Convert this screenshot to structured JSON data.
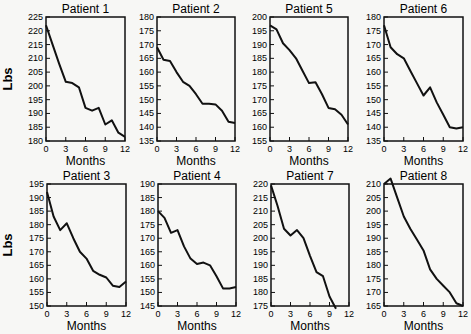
{
  "ylabel": "Lbs",
  "xlabel": "Months",
  "chart_data": [
    {
      "type": "line",
      "title": "Patient 1",
      "xlabel": "Months",
      "ylabel": "Lbs",
      "ylim": [
        180,
        225
      ],
      "yticks": [
        180,
        185,
        190,
        195,
        200,
        205,
        210,
        215,
        220,
        225
      ],
      "xticks": [
        0,
        3,
        6,
        9,
        12
      ],
      "x": [
        0,
        1,
        2,
        3,
        4,
        5,
        6,
        7,
        8,
        9,
        10,
        11,
        12
      ],
      "values": [
        222,
        215,
        208,
        201.5,
        201,
        199.5,
        192,
        191,
        192,
        186,
        187.5,
        183,
        181.5
      ]
    },
    {
      "type": "line",
      "title": "Patient 2",
      "xlabel": "Months",
      "ylabel": "",
      "ylim": [
        135,
        180
      ],
      "yticks": [
        135,
        140,
        145,
        150,
        155,
        160,
        165,
        170,
        175,
        180
      ],
      "xticks": [
        0,
        3,
        6,
        9,
        12
      ],
      "x": [
        0,
        1,
        2,
        3,
        4,
        5,
        6,
        7,
        8,
        9,
        10,
        11,
        12
      ],
      "values": [
        169,
        164.5,
        164,
        160,
        156.5,
        155,
        152,
        148.5,
        148.5,
        148.3,
        146,
        142,
        141.5
      ]
    },
    {
      "type": "line",
      "title": "Patient 5",
      "xlabel": "Months",
      "ylabel": "",
      "ylim": [
        155,
        200
      ],
      "yticks": [
        155,
        160,
        165,
        170,
        175,
        180,
        185,
        190,
        195,
        200
      ],
      "xticks": [
        0,
        3,
        6,
        9,
        12
      ],
      "x": [
        0,
        1,
        2,
        3,
        4,
        5,
        6,
        7,
        8,
        9,
        10,
        11,
        12
      ],
      "values": [
        197,
        195.5,
        190.5,
        188,
        185,
        180.5,
        176,
        176.3,
        172,
        167,
        166.5,
        164.5,
        161
      ]
    },
    {
      "type": "line",
      "title": "Patient 6",
      "xlabel": "Months",
      "ylabel": "",
      "ylim": [
        135,
        180
      ],
      "yticks": [
        135,
        140,
        145,
        150,
        155,
        160,
        165,
        170,
        175,
        180
      ],
      "xticks": [
        0,
        3,
        6,
        9,
        12
      ],
      "x": [
        0,
        1,
        2,
        3,
        4,
        5,
        6,
        7,
        8,
        9,
        10,
        11,
        12
      ],
      "values": [
        177,
        169,
        166.5,
        165,
        160.5,
        156,
        151.5,
        154.5,
        149,
        144.5,
        140,
        139.5,
        140
      ]
    },
    {
      "type": "line",
      "title": "Patient 3",
      "xlabel": "Months",
      "ylabel": "Lbs",
      "ylim": [
        150,
        195
      ],
      "yticks": [
        150,
        155,
        160,
        165,
        170,
        175,
        180,
        185,
        190,
        195
      ],
      "xticks": [
        0,
        3,
        6,
        9,
        12
      ],
      "x": [
        0,
        1,
        2,
        3,
        4,
        5,
        6,
        7,
        8,
        9,
        10,
        11,
        12
      ],
      "values": [
        192,
        183,
        178,
        180.5,
        175,
        170,
        167.5,
        163,
        161.5,
        160.5,
        157.5,
        157,
        159
      ]
    },
    {
      "type": "line",
      "title": "Patient 4",
      "xlabel": "Months",
      "ylabel": "",
      "ylim": [
        145,
        190
      ],
      "yticks": [
        145,
        150,
        155,
        160,
        165,
        170,
        175,
        180,
        185,
        190
      ],
      "xticks": [
        0,
        3,
        6,
        9,
        12
      ],
      "x": [
        0,
        1,
        2,
        3,
        4,
        5,
        6,
        7,
        8,
        9,
        10,
        11,
        12
      ],
      "values": [
        180,
        177.5,
        172,
        173,
        167,
        162.5,
        160.5,
        161,
        160,
        156,
        151.5,
        151.5,
        152
      ]
    },
    {
      "type": "line",
      "title": "Patient 7",
      "xlabel": "Months",
      "ylabel": "",
      "ylim": [
        175,
        220
      ],
      "yticks": [
        175,
        180,
        185,
        190,
        195,
        200,
        205,
        210,
        215,
        220
      ],
      "xticks": [
        0,
        3,
        6,
        9,
        12
      ],
      "x": [
        0,
        1,
        2,
        3,
        4,
        5,
        6,
        7,
        8,
        9,
        10,
        11,
        12
      ],
      "values": [
        219.5,
        212,
        203.5,
        201,
        203,
        200,
        193.5,
        187.5,
        186,
        178.5,
        174,
        null,
        null
      ]
    },
    {
      "type": "line",
      "title": "Patient 8",
      "xlabel": "Months",
      "ylabel": "",
      "ylim": [
        165,
        210
      ],
      "yticks": [
        165,
        170,
        175,
        180,
        185,
        190,
        195,
        200,
        205,
        210
      ],
      "xticks": [
        0,
        3,
        6,
        9,
        12
      ],
      "x": [
        0,
        1,
        2,
        3,
        4,
        5,
        6,
        7,
        8,
        9,
        10,
        11,
        12
      ],
      "values": [
        210,
        212,
        205,
        198,
        193.5,
        189.5,
        185.5,
        178.5,
        175,
        172.5,
        170,
        166,
        165
      ]
    }
  ]
}
